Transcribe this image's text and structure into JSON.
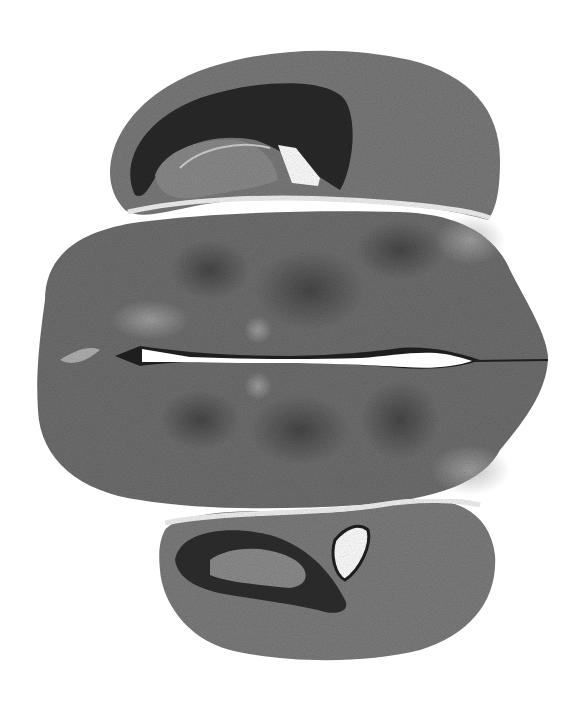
{
  "image": {
    "kind": "grayscale histology micrograph",
    "subject": "horizontal section of brain tissue (diencephalon with paired hippocampal/cortical lobes)",
    "background_color": "#ffffff",
    "tissue_tones": {
      "light": "#9a9a9a",
      "mid": "#707070",
      "dark": "#3a3a3a",
      "darkest": "#1e1e1e"
    },
    "regions": [
      {
        "name": "upper-hippocampal-lobe",
        "position": "top"
      },
      {
        "name": "central-diencephalon-mass",
        "position": "middle"
      },
      {
        "name": "midline-third-ventricle",
        "position": "center-horizontal"
      },
      {
        "name": "lower-hippocampal-lobe",
        "position": "bottom"
      }
    ]
  }
}
